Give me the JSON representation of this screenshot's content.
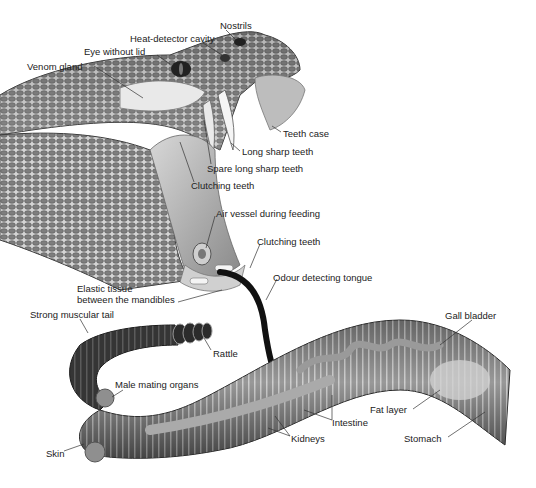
{
  "figure": {
    "labels": [
      {
        "id": "nostrils",
        "text": "Nostrils",
        "x": 220,
        "y": 20
      },
      {
        "id": "heat-detector-cavity",
        "text": "Heat-detector cavity",
        "x": 130,
        "y": 33
      },
      {
        "id": "eye-without-lid",
        "text": "Eye without lid",
        "x": 84,
        "y": 46
      },
      {
        "id": "venom-gland",
        "text": "Venom gland",
        "x": 27,
        "y": 61
      },
      {
        "id": "teeth-case",
        "text": "Teeth case",
        "x": 283,
        "y": 128
      },
      {
        "id": "long-sharp-teeth",
        "text": "Long sharp teeth",
        "x": 242,
        "y": 146
      },
      {
        "id": "spare-long-sharp-teeth",
        "text": "Spare long sharp teeth",
        "x": 207,
        "y": 163
      },
      {
        "id": "clutching-teeth-1",
        "text": "Clutching teeth",
        "x": 191,
        "y": 180
      },
      {
        "id": "air-vessel",
        "text": "Air vessel during feeding",
        "x": 216,
        "y": 208
      },
      {
        "id": "clutching-teeth-2",
        "text": "Clutching teeth",
        "x": 257,
        "y": 236
      },
      {
        "id": "odour-detecting-tongue",
        "text": "Odour detecting tongue",
        "x": 273,
        "y": 272
      },
      {
        "id": "elastic-tissue",
        "text": "Elastic tissue\nbetween the mandibles",
        "x": 77,
        "y": 283
      },
      {
        "id": "strong-muscular-tail",
        "text": "Strong muscular tail",
        "x": 30,
        "y": 309
      },
      {
        "id": "rattle",
        "text": "Rattle",
        "x": 213,
        "y": 348
      },
      {
        "id": "gall-bladder",
        "text": "Gall bladder",
        "x": 445,
        "y": 310
      },
      {
        "id": "male-mating-organs",
        "text": "Male mating organs",
        "x": 115,
        "y": 379
      },
      {
        "id": "fat-layer",
        "text": "Fat layer",
        "x": 370,
        "y": 404
      },
      {
        "id": "intestine",
        "text": "Intestine",
        "x": 332,
        "y": 417
      },
      {
        "id": "kidneys",
        "text": "Kidneys",
        "x": 291,
        "y": 433
      },
      {
        "id": "stomach",
        "text": "Stomach",
        "x": 404,
        "y": 433
      },
      {
        "id": "skin",
        "text": "Skin",
        "x": 46,
        "y": 448
      }
    ]
  }
}
